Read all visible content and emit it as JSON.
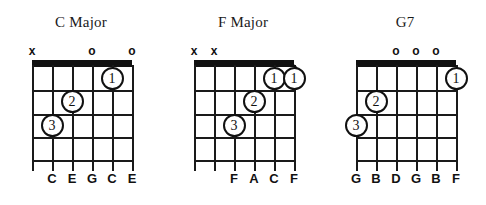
{
  "figure": {
    "background": "#ffffff",
    "ink": "#111111",
    "string_count": 6,
    "fret_count": 4
  },
  "chord_data": {
    "type": "diagram",
    "diagram_kind": "guitar-chord-chart",
    "chords": [
      {
        "name": "C Major",
        "open_strings": [
          4,
          6
        ],
        "muted_strings": [
          1
        ],
        "markers": [
          {
            "string": 1,
            "symbol": "x"
          },
          {
            "string": 4,
            "symbol": "o"
          },
          {
            "string": 6,
            "symbol": "o"
          }
        ],
        "fingering": [
          {
            "finger": "1",
            "string": 5,
            "fret": 1
          },
          {
            "finger": "2",
            "string": 3,
            "fret": 2
          },
          {
            "finger": "3",
            "string": 2,
            "fret": 3
          }
        ],
        "barre": null,
        "notes": [
          {
            "string": 2,
            "label": "C"
          },
          {
            "string": 3,
            "label": "E"
          },
          {
            "string": 4,
            "label": "G"
          },
          {
            "string": 5,
            "label": "C"
          },
          {
            "string": 6,
            "label": "E"
          }
        ]
      },
      {
        "name": "F Major",
        "open_strings": [],
        "muted_strings": [
          1,
          2
        ],
        "markers": [
          {
            "string": 1,
            "symbol": "x"
          },
          {
            "string": 2,
            "symbol": "x"
          }
        ],
        "fingering": [
          {
            "finger": "1",
            "string": 5,
            "fret": 1
          },
          {
            "finger": "1",
            "string": 6,
            "fret": 1
          },
          {
            "finger": "2",
            "string": 4,
            "fret": 2
          },
          {
            "finger": "3",
            "string": 3,
            "fret": 3
          }
        ],
        "barre": {
          "fret": 1,
          "from_string": 5,
          "to_string": 6
        },
        "notes": [
          {
            "string": 3,
            "label": "F"
          },
          {
            "string": 4,
            "label": "A"
          },
          {
            "string": 5,
            "label": "C"
          },
          {
            "string": 6,
            "label": "F"
          }
        ]
      },
      {
        "name": "G7",
        "open_strings": [
          3,
          4,
          5
        ],
        "muted_strings": [],
        "markers": [
          {
            "string": 3,
            "symbol": "o"
          },
          {
            "string": 4,
            "symbol": "o"
          },
          {
            "string": 5,
            "symbol": "o"
          }
        ],
        "fingering": [
          {
            "finger": "1",
            "string": 6,
            "fret": 1
          },
          {
            "finger": "2",
            "string": 2,
            "fret": 2
          },
          {
            "finger": "3",
            "string": 1,
            "fret": 3
          }
        ],
        "barre": null,
        "notes": [
          {
            "string": 1,
            "label": "G"
          },
          {
            "string": 2,
            "label": "B"
          },
          {
            "string": 3,
            "label": "D"
          },
          {
            "string": 4,
            "label": "G"
          },
          {
            "string": 5,
            "label": "B"
          },
          {
            "string": 6,
            "label": "F"
          }
        ]
      }
    ]
  }
}
